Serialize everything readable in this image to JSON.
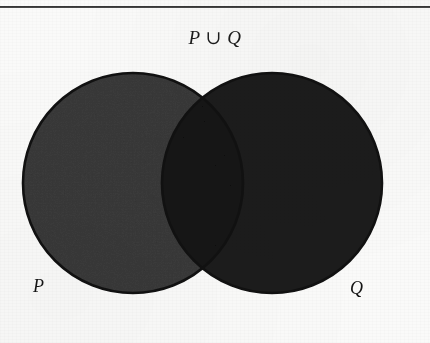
{
  "figure": {
    "title": "P ∪ Q",
    "operation": "union",
    "type": "venn-diagram-2-set",
    "background_color": "#fafaf9",
    "rule": {
      "visible": true,
      "color": "#2b2b2b",
      "thickness_px": 2,
      "y": 6
    }
  },
  "sets": {
    "left": {
      "name": "P",
      "label": "P",
      "fill_color": "#3b3b3b",
      "stroke_color": "#111111",
      "center_x": 133,
      "center_y": 183,
      "radius": 110
    },
    "right": {
      "name": "Q",
      "label": "Q",
      "fill_color": "#1d1d1d",
      "stroke_color": "#111111",
      "center_x": 272,
      "center_y": 183,
      "radius": 110
    }
  },
  "regions": {
    "intersection": {
      "name": "P ∩ Q",
      "fill_color": "#141414",
      "shaded": true
    },
    "left_only": {
      "name": "P \\ Q",
      "fill_color": "#3b3b3b",
      "shaded": true
    },
    "right_only": {
      "name": "Q \\ P",
      "fill_color": "#1d1d1d",
      "shaded": true
    },
    "outside": {
      "name": "complement",
      "fill_color": "#fafaf9",
      "shaded": false
    }
  },
  "symbols": {
    "union": "∪",
    "intersection": "∩"
  }
}
